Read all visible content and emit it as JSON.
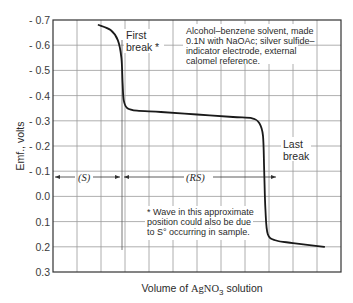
{
  "chart_data": {
    "type": "line",
    "title": "",
    "xlabel": "Volume of AgNO3 solution",
    "xlabel_parts": {
      "pre": "Volume of ",
      "chem": "AgNO",
      "sub": "3",
      "post": " solution"
    },
    "ylabel": "Emf., volts",
    "ylim": [
      -0.7,
      0.3
    ],
    "y_ticks": [
      "- 0.7",
      "- 0.6",
      "- 0.5",
      "- 0.4",
      "- 0.3",
      "- 0.2",
      "- 0.1",
      "0.0",
      "0.1",
      "0.2",
      "0.3"
    ],
    "y_tick_values": [
      -0.7,
      -0.6,
      -0.5,
      -0.4,
      -0.3,
      -0.2,
      -0.1,
      0.0,
      0.1,
      0.2,
      0.3
    ],
    "x_grid_divisions": 12,
    "grid": true,
    "x_units": "arbitrary (grid divisions)",
    "series": [
      {
        "name": "Titration curve",
        "x": [
          1.9,
          2.4,
          2.7,
          2.85,
          2.9,
          2.95,
          3.1,
          3.5,
          4.5,
          6.0,
          7.5,
          8.3,
          8.6,
          8.75,
          8.8,
          8.85,
          8.95,
          9.3,
          10.0,
          11.3
        ],
        "y": [
          -0.68,
          -0.66,
          -0.62,
          -0.55,
          -0.45,
          -0.38,
          -0.35,
          -0.34,
          -0.335,
          -0.325,
          -0.315,
          -0.31,
          -0.29,
          -0.24,
          -0.1,
          0.05,
          0.15,
          0.175,
          0.185,
          0.2
        ]
      }
    ],
    "annotations": [
      {
        "text": "First break *",
        "x": 3.0,
        "y": -0.6
      },
      {
        "text": "Last break",
        "x": 9.4,
        "y": -0.2
      },
      {
        "text": "(S)",
        "span_x": [
          0,
          2.85
        ],
        "y": -0.08
      },
      {
        "text": "(RS)",
        "span_x": [
          2.85,
          8.75
        ],
        "y": -0.08
      },
      {
        "text": "Alcohol–benzene solvent, made 0.1N with NaOAc; silver sulfide–indicator electrode, external calomel reference."
      },
      {
        "text": "* Wave in this approximate position could also be due to S° occurring in sample."
      }
    ]
  },
  "labels": {
    "first_break_1": "First",
    "first_break_2": "break",
    "first_break_star": "*",
    "last_break_1": "Last",
    "last_break_2": "break",
    "s_region": "(S)",
    "rs_region": "(RS)",
    "note_lines": [
      "Alcohol–benzene solvent, made",
      "0.1N with NaOAc; silver sulfide–",
      "indicator electrode, external",
      "calomel reference."
    ],
    "footnote_lines": [
      "* Wave in this approximate",
      "position could also be due",
      "to S° occurring in sample."
    ],
    "ylabel": "Emf., volts"
  }
}
